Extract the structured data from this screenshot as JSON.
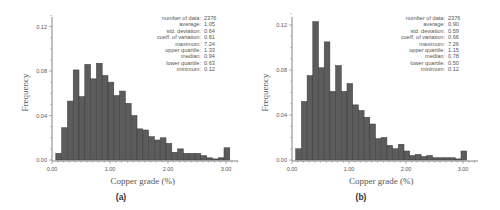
{
  "chart_data": [
    {
      "id": "a",
      "type": "bar",
      "caption": "(a)",
      "title": "",
      "xlabel": "Copper grade (%)",
      "ylabel": "Frequency",
      "xlim": [
        0,
        3.2
      ],
      "ylim": [
        0,
        0.13
      ],
      "x_ticks": [
        "0.00",
        "1.00",
        "2.00",
        "3.00"
      ],
      "y_ticks": [
        "0.00",
        "0.04",
        "0.08",
        "0.12"
      ],
      "bin_width": 0.1,
      "bin_start": 0.1,
      "values": [
        0.006,
        0.029,
        0.053,
        0.081,
        0.057,
        0.086,
        0.073,
        0.087,
        0.076,
        0.07,
        0.058,
        0.062,
        0.051,
        0.04,
        0.028,
        0.027,
        0.021,
        0.018,
        0.02,
        0.015,
        0.007,
        0.01,
        0.006,
        0.006,
        0.006,
        0.004,
        0.002,
        0.001,
        0.002,
        0.011
      ],
      "grid": false,
      "stats": [
        {
          "label": "number of data:",
          "value": "2376"
        },
        {
          "label": "average:",
          "value": "1.05"
        },
        {
          "label": "std. deviation:",
          "value": "0.64"
        },
        {
          "label": "coeff. of variation:",
          "value": "0.61"
        },
        {
          "label": "maximum:",
          "value": "7.24"
        },
        {
          "label": "upper quartile:",
          "value": "1.33"
        },
        {
          "label": "median:",
          "value": "0.94"
        },
        {
          "label": "lower quartile:",
          "value": "0.63"
        },
        {
          "label": "minimum:",
          "value": "0.12"
        }
      ]
    },
    {
      "id": "b",
      "type": "bar",
      "caption": "(b)",
      "title": "",
      "xlabel": "Copper grade (%)",
      "ylabel": "Frequency",
      "xlim": [
        0,
        3.2
      ],
      "ylim": [
        0,
        0.13
      ],
      "x_ticks": [
        "0.00",
        "1.00",
        "2.00",
        "3.00"
      ],
      "y_ticks": [
        "0.00",
        "0.04",
        "0.08",
        "0.12"
      ],
      "bin_width": 0.1,
      "bin_start": 0.1,
      "values": [
        0.01,
        0.052,
        0.075,
        0.123,
        0.082,
        0.105,
        0.061,
        0.084,
        0.061,
        0.068,
        0.049,
        0.044,
        0.038,
        0.032,
        0.019,
        0.02,
        0.013,
        0.01,
        0.014,
        0.008,
        0.004,
        0.005,
        0.003,
        0.004,
        0.002,
        0.002,
        0.002,
        0.002,
        0.001,
        0.008
      ],
      "grid": false,
      "stats": [
        {
          "label": "number of data:",
          "value": "2376"
        },
        {
          "label": "average:",
          "value": "0.90"
        },
        {
          "label": "std. deviation:",
          "value": "0.59"
        },
        {
          "label": "coeff. of variation:",
          "value": "0.66"
        },
        {
          "label": "maximum:",
          "value": "7.26"
        },
        {
          "label": "upper quartile:",
          "value": "1.15"
        },
        {
          "label": "median:",
          "value": "0.78"
        },
        {
          "label": "lower quartile:",
          "value": "0.50"
        },
        {
          "label": "minimum:",
          "value": "0.12"
        }
      ]
    }
  ],
  "colors": {
    "bar_fill": "#5c5c5c",
    "bar_edge": "#3a3a3a",
    "axis": "#666666",
    "text": "#555555"
  }
}
